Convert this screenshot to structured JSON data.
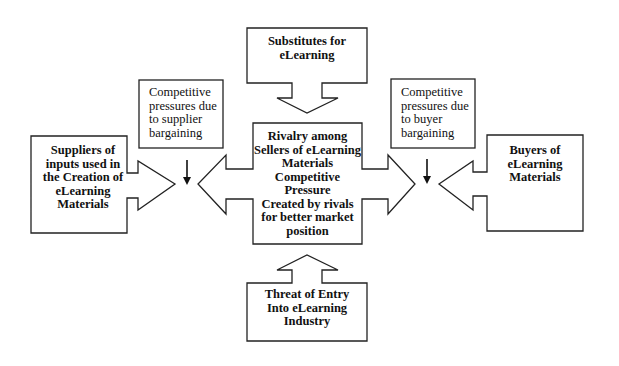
{
  "diagram": {
    "type": "five-forces",
    "colors": {
      "stroke": "#222222",
      "fill": "#ffffff",
      "text": "#111111"
    },
    "nodes": {
      "substitutes": {
        "lines": [
          "Substitutes for",
          "eLearning"
        ]
      },
      "suppliers": {
        "lines": [
          "Suppliers of",
          "inputs used in",
          "the Creation of",
          "eLearning",
          "Materials"
        ]
      },
      "rivalry": {
        "lines": [
          "Rivalry among",
          "Sellers of eLearning",
          "Materials",
          "Competitive",
          "Pressure",
          "Created by rivals",
          "for better market",
          "position"
        ]
      },
      "buyers": {
        "lines": [
          "Buyers of",
          "eLearning",
          "Materials"
        ]
      },
      "new_entrants": {
        "lines": [
          "Threat of Entry",
          "Into eLearning",
          "Industry"
        ]
      },
      "supplier_pressure": {
        "lines": [
          "Competitive",
          "pressures due",
          "to supplier",
          "bargaining"
        ]
      },
      "buyer_pressure": {
        "lines": [
          "Competitive",
          "pressures due",
          "to buyer",
          "bargaining"
        ]
      }
    },
    "edges": [
      {
        "from": "substitutes",
        "to": "rivalry",
        "direction": "down"
      },
      {
        "from": "new_entrants",
        "to": "rivalry",
        "direction": "up"
      },
      {
        "from": "suppliers",
        "to": "center",
        "direction": "right"
      },
      {
        "from": "buyers",
        "to": "center",
        "direction": "left"
      },
      {
        "from": "rivalry",
        "to": "left",
        "direction": "left"
      },
      {
        "from": "rivalry",
        "to": "right",
        "direction": "right"
      },
      {
        "from": "supplier_pressure",
        "to": "supplier-arrow",
        "direction": "down"
      },
      {
        "from": "buyer_pressure",
        "to": "buyer-arrow",
        "direction": "down"
      }
    ]
  }
}
